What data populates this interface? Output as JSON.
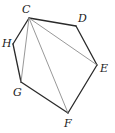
{
  "diagram": {
    "type": "polygon-with-diagonals",
    "vertices": [
      {
        "name": "C",
        "x": 29,
        "y": 18,
        "label_x": 22,
        "label_y": 13
      },
      {
        "name": "D",
        "x": 76,
        "y": 26,
        "label_x": 78,
        "label_y": 22
      },
      {
        "name": "E",
        "x": 97,
        "y": 65,
        "label_x": 100,
        "label_y": 72
      },
      {
        "name": "F",
        "x": 68,
        "y": 113,
        "label_x": 64,
        "label_y": 127
      },
      {
        "name": "G",
        "x": 21,
        "y": 82,
        "label_x": 13,
        "label_y": 96
      },
      {
        "name": "H",
        "x": 13,
        "y": 44,
        "label_x": 2,
        "label_y": 47
      }
    ],
    "edges": [
      [
        "C",
        "D"
      ],
      [
        "D",
        "E"
      ],
      [
        "E",
        "F"
      ],
      [
        "F",
        "G"
      ],
      [
        "G",
        "H"
      ],
      [
        "H",
        "C"
      ]
    ],
    "diagonals": [
      [
        "C",
        "G"
      ],
      [
        "C",
        "F"
      ],
      [
        "C",
        "E"
      ]
    ],
    "labels": {
      "C": "C",
      "D": "D",
      "E": "E",
      "F": "F",
      "G": "G",
      "H": "H"
    },
    "colors": {
      "edge": "#2a2a2a",
      "diagonal": "#8c8c8c",
      "background": "#ffffff"
    }
  }
}
